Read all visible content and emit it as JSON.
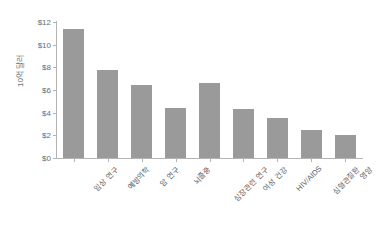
{
  "chart_data": {
    "type": "bar",
    "title": "",
    "xlabel": "",
    "ylabel": "10억 달러",
    "categories": [
      "임상 연구",
      "예방의학",
      "암 연구",
      "뇌졸중",
      "심장관련 연구",
      "여성 건강",
      "HIV/AIDS",
      "심혈관질환",
      "영양"
    ],
    "values": [
      11.4,
      7.8,
      6.4,
      4.4,
      6.6,
      4.3,
      3.5,
      2.45,
      2.05
    ],
    "ylim": [
      0,
      12
    ],
    "yticks": [
      0,
      2,
      4,
      6,
      8,
      10,
      12
    ],
    "ytick_labels": [
      "$0",
      "$2",
      "$4",
      "$6",
      "$8",
      "$10",
      "$12"
    ],
    "grid": false,
    "legend": null,
    "bar_color": "#9a9a9a",
    "axis_color": "#b4b4b4",
    "background": "#ffffff"
  }
}
